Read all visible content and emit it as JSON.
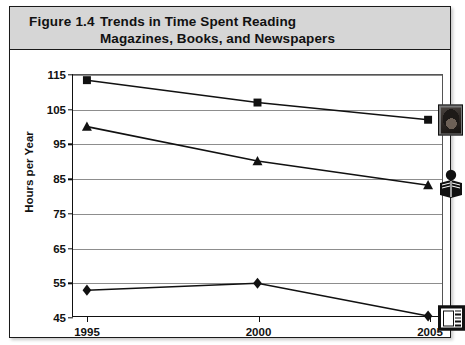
{
  "figure": {
    "number_label": "Figure 1.4",
    "title_line1": "Trends in Time Spent Reading",
    "title_line2": "Magazines, Books, and Newspapers"
  },
  "chart_data": {
    "type": "line",
    "title": "Trends in Time Spent Reading Magazines, Books, and Newspapers",
    "xlabel": "",
    "ylabel": "Hours per Year",
    "x": [
      "1995",
      "2000",
      "2005"
    ],
    "categories": [
      "1995",
      "2000",
      "2005"
    ],
    "ylim": [
      45,
      115
    ],
    "yticks": [
      45,
      55,
      65,
      75,
      85,
      95,
      105,
      115
    ],
    "ytick_labels": [
      "45",
      "55",
      "65",
      "75",
      "85",
      "95",
      "105",
      "115"
    ],
    "grid": true,
    "legend_position": "end-of-line-icons",
    "series": [
      {
        "name": "Magazines",
        "marker": "square",
        "icon": "magazine-cover-icon",
        "values": [
          113.5,
          107,
          102
        ]
      },
      {
        "name": "Books",
        "marker": "triangle",
        "icon": "person-reading-book-icon",
        "values": [
          100,
          90,
          83
        ]
      },
      {
        "name": "Newspapers",
        "marker": "diamond",
        "icon": "newspaper-icon",
        "values": [
          52.5,
          54.5,
          45
        ]
      }
    ],
    "colors": {
      "line": "#111111",
      "grid": "#8d8d8d",
      "axis": "#111111",
      "banner": "#d6d6d6"
    }
  }
}
